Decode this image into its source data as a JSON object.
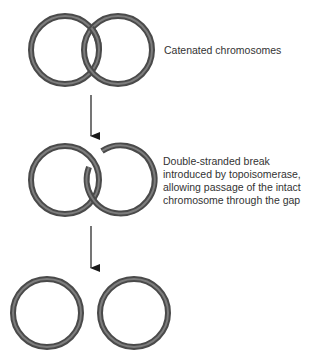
{
  "figure": {
    "steps": [
      {
        "id": "catenated",
        "label_lines": [
          "Catenated chromosomes"
        ],
        "rings": [
          {
            "cx": 65,
            "cy": 50,
            "r": 34
          },
          {
            "cx": 118,
            "cy": 50,
            "r": 34
          }
        ]
      },
      {
        "id": "double-strand-break",
        "label_lines": [
          "Double-stranded break",
          "introduced by topoisomerase,",
          "allowing passage of the intact",
          "chromosome through the gap"
        ],
        "rings": [
          {
            "cx": 65,
            "cy": 180,
            "r": 34
          },
          {
            "cx": 120,
            "cy": 180,
            "r": 34,
            "gap": true
          }
        ]
      },
      {
        "id": "separated",
        "label_lines": [],
        "rings": [
          {
            "cx": 47,
            "cy": 313,
            "r": 34
          },
          {
            "cx": 134,
            "cy": 313,
            "r": 34
          }
        ]
      }
    ],
    "arrows": [
      {
        "x": 91,
        "y1": 95,
        "y2": 136
      },
      {
        "x": 91,
        "y1": 226,
        "y2": 268
      }
    ],
    "colors": {
      "ring_outer": "#4a4a4a",
      "ring_inner": "#8a8a8a",
      "arrow": "#1a1a1a",
      "text": "#333333"
    }
  }
}
